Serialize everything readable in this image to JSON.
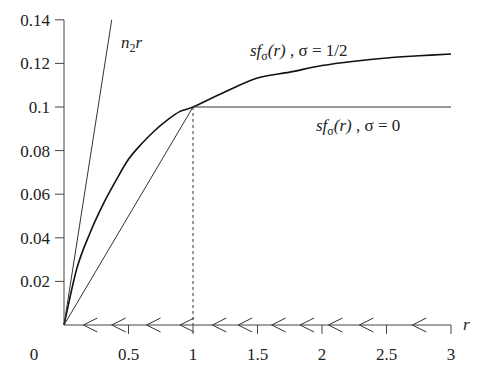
{
  "chart_data": {
    "type": "line",
    "title": "",
    "xlabel": "r",
    "ylabel": "",
    "xlim": [
      0,
      3
    ],
    "ylim": [
      0,
      0.14
    ],
    "grid": false,
    "x_ticks": [
      "0",
      "0.5",
      "1",
      "1.5",
      "2",
      "2.5",
      "3"
    ],
    "y_ticks": [
      "0.02",
      "0.04",
      "0.06",
      "0.08",
      "0.1",
      "0.12",
      "0.14"
    ],
    "series": [
      {
        "name": "sf_σ(r), σ=1/2",
        "style": "solid-thick",
        "x": [
          0,
          0.1,
          0.2,
          0.3,
          0.4,
          0.5,
          0.6,
          0.7,
          0.8,
          0.9,
          1.0,
          1.25,
          1.5,
          1.75,
          2.0,
          2.25,
          2.5,
          2.75,
          3.0
        ],
        "values": [
          0,
          0.026,
          0.042,
          0.055,
          0.066,
          0.076,
          0.083,
          0.089,
          0.094,
          0.098,
          0.1,
          0.107,
          0.1133,
          0.116,
          0.119,
          0.121,
          0.1225,
          0.1235,
          0.1243
        ]
      },
      {
        "name": "sf_σ(r), σ=0",
        "style": "solid-thin",
        "x": [
          0,
          1,
          3
        ],
        "values": [
          0,
          0.1,
          0.1
        ]
      },
      {
        "name": "n_2 r",
        "style": "solid-thin",
        "x": [
          0,
          0.37
        ],
        "values": [
          0,
          0.14
        ]
      }
    ],
    "annotations": [
      {
        "text": "dashed vertical line at r = 1 from 0 to 0.1"
      },
      {
        "text": "left-pointing arrows along r-axis indicating flow direction toward r = 0"
      }
    ],
    "arrow_positions_r": [
      0.15,
      0.37,
      0.64,
      0.9,
      1.15,
      1.35,
      1.61,
      1.83,
      2.05,
      2.29,
      2.7
    ]
  },
  "labels": {
    "origin": "0",
    "x_axis_var": "r",
    "n2r": {
      "n": "n",
      "sub": "2",
      "r": "r"
    },
    "curve_half": {
      "prefix": "sf",
      "sub": "σ",
      "arg": "(r)",
      "suffix": " , σ = 1/2"
    },
    "curve_zero": {
      "prefix": "sf",
      "sub": "σ",
      "arg": "(r)",
      "suffix": " , σ = 0"
    }
  }
}
